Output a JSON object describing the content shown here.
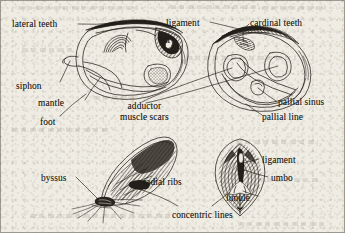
{
  "figure": {
    "kind": "bivalve-shell-anatomy-plate",
    "panels": [
      {
        "name": "panel-top-left",
        "description": "interior of left valve, oblique view"
      },
      {
        "name": "panel-top-right",
        "description": "interior of valve, dorsal/hinge view"
      },
      {
        "name": "panel-bottom-left",
        "description": "exterior of mussel shell with byssal threads"
      },
      {
        "name": "panel-bottom-right",
        "description": "exterior of valve, dorsal view"
      }
    ],
    "ink_color": "#221e19",
    "paper_color": "#efece4"
  },
  "labels": [
    {
      "id": "lateral-teeth",
      "text": "lateral teeth",
      "x": 12,
      "y": 19,
      "lines": 1
    },
    {
      "id": "pit",
      "text": "pit",
      "x": 160,
      "y": 35,
      "lines": 1
    },
    {
      "id": "siphon",
      "text": "siphon",
      "x": 16,
      "y": 81,
      "lines": 1
    },
    {
      "id": "mantle",
      "text": "mantle",
      "x": 38,
      "y": 98,
      "lines": 1
    },
    {
      "id": "foot",
      "text": "foot",
      "x": 40,
      "y": 117,
      "lines": 1
    },
    {
      "id": "ligament-top",
      "text": "ligament",
      "x": 166,
      "y": 18,
      "lines": 1
    },
    {
      "id": "cardinal-teeth",
      "text": "cardinal teeth",
      "x": 250,
      "y": 18,
      "lines": 1
    },
    {
      "id": "pallial-sinus",
      "text": "pallial sinus",
      "x": 278,
      "y": 97,
      "lines": 1
    },
    {
      "id": "pallial-line",
      "text": "pallial line",
      "x": 262,
      "y": 112,
      "lines": 1
    },
    {
      "id": "adductor-muscle-scars",
      "text": "adductor\nmuscle scars",
      "x": 120,
      "y": 102,
      "lines": 2
    },
    {
      "id": "byssus",
      "text": "byssus",
      "x": 41,
      "y": 173,
      "lines": 1
    },
    {
      "id": "radial-ribs",
      "text": "radial ribs",
      "x": 143,
      "y": 177,
      "lines": 1
    },
    {
      "id": "concentric-lines",
      "text": "concentric lines",
      "x": 172,
      "y": 210,
      "lines": 1
    },
    {
      "id": "ligament-bottom",
      "text": "ligament",
      "x": 262,
      "y": 155,
      "lines": 1
    },
    {
      "id": "umbo",
      "text": "umbo",
      "x": 271,
      "y": 173,
      "lines": 1
    },
    {
      "id": "lunule",
      "text": "lunule",
      "x": 226,
      "y": 193,
      "lines": 1
    }
  ]
}
